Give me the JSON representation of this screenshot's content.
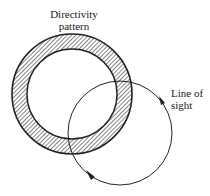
{
  "diagram": {
    "labels": {
      "directivity_line1": "Directivity",
      "directivity_line2": "pattern",
      "sight_line1": "Line of",
      "sight_line2": "sight"
    },
    "colors": {
      "stroke": "#222222",
      "background": "#ffffff"
    },
    "shapes": {
      "directivity_ring": {
        "cx": 72,
        "cy": 94,
        "outer_r": 60,
        "inner_r": 45,
        "fill": "hatched"
      },
      "line_of_sight_circle": {
        "cx": 120,
        "cy": 133,
        "r": 52,
        "arrows": 2
      }
    }
  }
}
